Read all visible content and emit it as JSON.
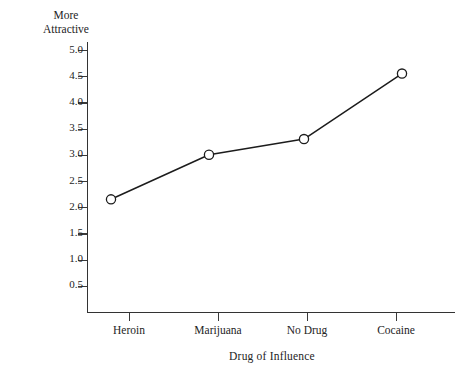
{
  "chart_data": {
    "type": "line",
    "title": "",
    "categories": [
      "Heroin",
      "Marijuana",
      "No Drug",
      "Cocaine"
    ],
    "values": [
      2.15,
      3.0,
      3.3,
      4.55
    ],
    "series": [
      {
        "name": "Attractive Ratings (Means)",
        "values": [
          2.15,
          3.0,
          3.3,
          4.55
        ]
      }
    ],
    "xlabel": "Drug of Influence",
    "ylabel": "Attractive Ratings (Means)",
    "ylim": [
      0,
      5.0
    ],
    "ytick_labels": [
      "5.0",
      "4.5",
      "4.0",
      "3.5",
      "3.0",
      "2.5",
      "2.0",
      "1.5",
      "1.0",
      "0.5"
    ],
    "ytick_values": [
      5.0,
      4.5,
      4.0,
      3.5,
      3.0,
      2.5,
      2.0,
      1.5,
      1.0,
      0.5
    ],
    "annotations": [
      "More\nAttractive"
    ],
    "grid": false,
    "legend": "none",
    "marker": "open-circle",
    "line_color": "#1c1c1c",
    "marker_fill": "#ffffff",
    "axis_color": "#333333"
  },
  "labels": {
    "top_caption": "More\nAttractive",
    "x_axis_title": "Drug of Influence",
    "y_axis_title": "Attractive Ratings (Means)"
  }
}
